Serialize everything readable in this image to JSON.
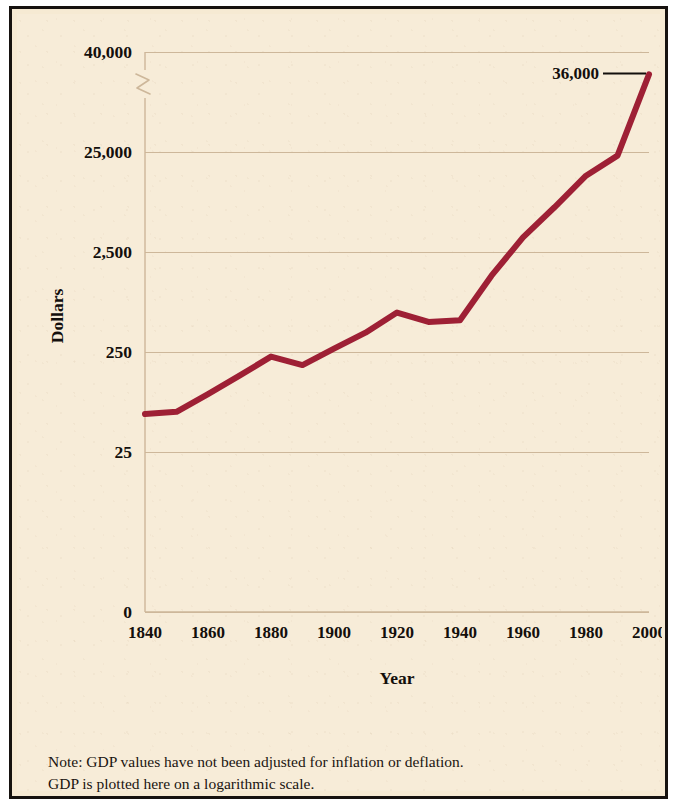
{
  "figure": {
    "background_color": "#f7ecd8",
    "outer_border_color": "#16120f",
    "inner_border_color": "#b5745f"
  },
  "note": {
    "line1": "Note: GDP values have not been adjusted for inflation or deflation.",
    "line2": "GDP is plotted here on a logarithmic scale."
  },
  "chart_data": {
    "type": "line",
    "title": "",
    "xlabel": "Year",
    "ylabel": "Dollars",
    "series_color": "#9e2035",
    "grid": true,
    "grid_color": "#cdb79a",
    "legend": "none",
    "scale": "logarithmic",
    "axis_break": true,
    "axis_break_note": "zigzag break on y-axis between 25,000 and 40,000",
    "ytick_labels": [
      "40,000",
      "25,000",
      "2,500",
      "250",
      "25",
      "0"
    ],
    "ytick_values": [
      40000,
      25000,
      2500,
      250,
      25,
      0
    ],
    "xtick_labels": [
      "1840",
      "1860",
      "1880",
      "1900",
      "1920",
      "1940",
      "1960",
      "1980",
      "2000"
    ],
    "xtick_values": [
      1840,
      1860,
      1880,
      1900,
      1920,
      1940,
      1960,
      1980,
      2000
    ],
    "xlim": [
      1840,
      2000
    ],
    "annotations": [
      {
        "text": "36,000",
        "x": 2000,
        "y": 36000
      }
    ],
    "x": [
      1840,
      1850,
      1860,
      1870,
      1880,
      1890,
      1900,
      1910,
      1920,
      1930,
      1940,
      1950,
      1960,
      1970,
      1980,
      1990,
      2000
    ],
    "values": [
      60,
      63,
      95,
      145,
      225,
      185,
      270,
      390,
      620,
      500,
      520,
      1450,
      3500,
      7000,
      14500,
      23000,
      36000
    ],
    "series": [
      {
        "name": "GDP",
        "values": [
          60,
          63,
          95,
          145,
          225,
          185,
          270,
          390,
          620,
          500,
          520,
          1450,
          3500,
          7000,
          14500,
          23000,
          36000
        ]
      }
    ]
  }
}
